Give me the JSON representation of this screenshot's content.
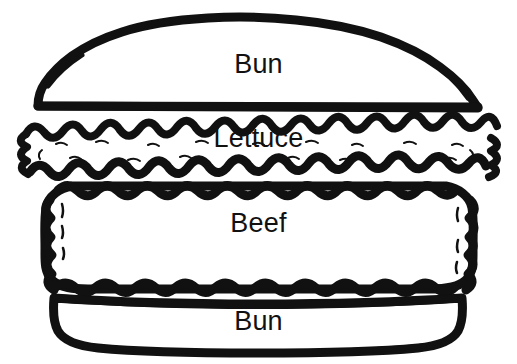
{
  "diagram": {
    "style": "black-and-white hand-drawn line art",
    "background_color": "#ffffff",
    "ink_color": "#111111",
    "label_color": "#111111",
    "layers": [
      {
        "id": "bun-top",
        "label": "Bun",
        "order": 1,
        "shape": "domed arch with flat base",
        "outline": "thick smooth hand-drawn ink",
        "fill": "#ffffff",
        "label_top_px": 51
      },
      {
        "id": "lettuce",
        "label": "Lettuce",
        "order": 2,
        "shape": "wide ruffled frilly band",
        "outline": "scalloped wavy hand-drawn ink with interior tick marks",
        "fill": "#ffffff",
        "label_top_px": 125
      },
      {
        "id": "beef",
        "label": "Beef",
        "order": 3,
        "shape": "rounded rectangle patty",
        "outline": "bumpy lumpy hand-drawn ink",
        "fill": "#ffffff",
        "label_top_px": 210
      },
      {
        "id": "bun-bottom",
        "label": "Bun",
        "order": 4,
        "shape": "shallow rounded trapezoid",
        "outline": "thick smooth hand-drawn ink",
        "fill": "#ffffff",
        "label_top_px": 308
      }
    ]
  }
}
